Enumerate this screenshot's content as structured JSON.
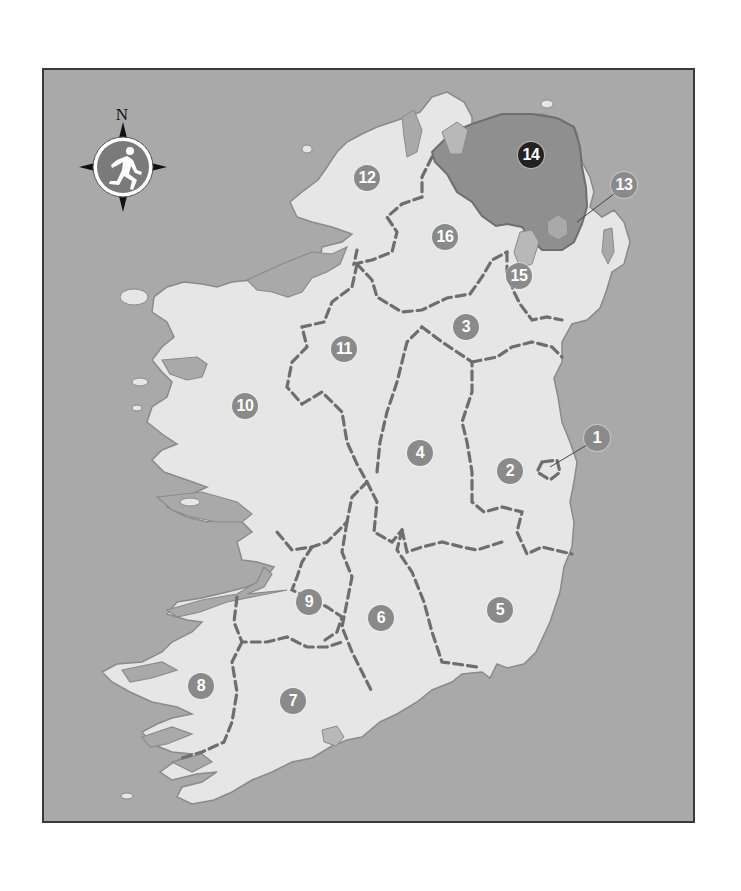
{
  "map": {
    "title": "Ireland provinces/regions map",
    "compass": {
      "north_label": "N",
      "icon": "running-figure-icon"
    },
    "colors": {
      "sea": "#a9a9a9",
      "land": "#e6e6e6",
      "highlight_region": "#8f8f8f",
      "border_dash": "#6e6e6e",
      "badge": "#8a8a8a",
      "badge_dark": "#222222",
      "frame": "#3a3a3a"
    },
    "regions": [
      {
        "id": "1",
        "label": "1",
        "x": 595,
        "y": 436
      },
      {
        "id": "2",
        "label": "2",
        "x": 508,
        "y": 469
      },
      {
        "id": "3",
        "label": "3",
        "x": 464,
        "y": 325
      },
      {
        "id": "4",
        "label": "4",
        "x": 418,
        "y": 451
      },
      {
        "id": "5",
        "label": "5",
        "x": 498,
        "y": 608
      },
      {
        "id": "6",
        "label": "6",
        "x": 379,
        "y": 616
      },
      {
        "id": "7",
        "label": "7",
        "x": 291,
        "y": 699
      },
      {
        "id": "8",
        "label": "8",
        "x": 199,
        "y": 684
      },
      {
        "id": "9",
        "label": "9",
        "x": 307,
        "y": 600
      },
      {
        "id": "10",
        "label": "10",
        "x": 243,
        "y": 404
      },
      {
        "id": "11",
        "label": "11",
        "x": 342,
        "y": 347
      },
      {
        "id": "12",
        "label": "12",
        "x": 365,
        "y": 176
      },
      {
        "id": "13",
        "label": "13",
        "x": 622,
        "y": 183
      },
      {
        "id": "14",
        "label": "14",
        "x": 529,
        "y": 153,
        "highlighted": true
      },
      {
        "id": "15",
        "label": "15",
        "x": 517,
        "y": 274
      },
      {
        "id": "16",
        "label": "16",
        "x": 443,
        "y": 235
      }
    ]
  }
}
